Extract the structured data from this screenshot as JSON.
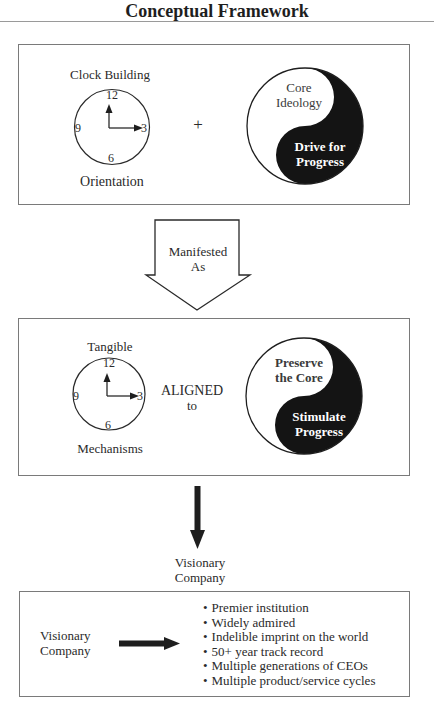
{
  "title": "Conceptual Framework",
  "panel_top": {
    "clock": {
      "label_top": "Clock Building",
      "label_bottom": "Orientation",
      "numerals": {
        "n12": "12",
        "n3": "3",
        "n6": "6",
        "n9": "9"
      }
    },
    "operator": "+",
    "yin_yang": {
      "light_text": [
        "Core",
        "Ideology"
      ],
      "dark_text": [
        "Drive for",
        "Progress"
      ]
    }
  },
  "transition_arrow": {
    "text": [
      "Manifested",
      "As"
    ]
  },
  "panel_middle": {
    "clock": {
      "label_top": "Tangible",
      "label_bottom": "Mechanisms",
      "numerals": {
        "n12": "12",
        "n3": "3",
        "n6": "6",
        "n9": "9"
      }
    },
    "operator": [
      "ALIGNED",
      "to"
    ],
    "yin_yang": {
      "light_text": [
        "Preserve",
        "the Core"
      ],
      "dark_text": [
        "Stimulate",
        "Progress"
      ]
    }
  },
  "result_label": [
    "Visionary",
    "Company"
  ],
  "panel_bottom": {
    "subject": [
      "Visionary",
      "Company"
    ],
    "characteristics": [
      "Premier institution",
      "Widely admired",
      "Indelible imprint on the world",
      "50+ year track record",
      "Multiple generations of CEOs",
      "Multiple product/service cycles"
    ]
  },
  "colors": {
    "ink": "#1e1e1e",
    "border": "#7a7a7a",
    "background": "#ffffff"
  }
}
